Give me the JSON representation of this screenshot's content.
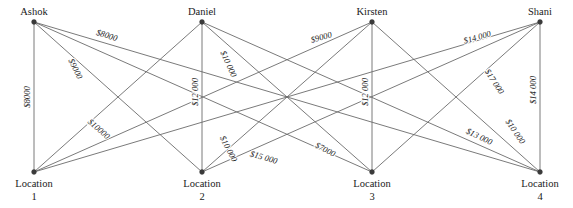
{
  "diagram": {
    "type": "bipartite-assignment-graph",
    "title": "",
    "people": [
      {
        "id": "ashok",
        "label": "Ashok",
        "x": 34,
        "y": 22
      },
      {
        "id": "daniel",
        "label": "Daniel",
        "x": 202,
        "y": 22
      },
      {
        "id": "kirsten",
        "label": "Kirsten",
        "x": 372,
        "y": 22
      },
      {
        "id": "shani",
        "label": "Shani",
        "x": 540,
        "y": 22
      }
    ],
    "locations": [
      {
        "id": "loc1",
        "label": "Location",
        "sub": "1",
        "x": 34,
        "y": 172
      },
      {
        "id": "loc2",
        "label": "Location",
        "sub": "2",
        "x": 202,
        "y": 172
      },
      {
        "id": "loc3",
        "label": "Location",
        "sub": "3",
        "x": 372,
        "y": 172
      },
      {
        "id": "loc4",
        "label": "Location",
        "sub": "4",
        "x": 540,
        "y": 172
      }
    ],
    "edges": [
      {
        "from": "ashok",
        "to": "loc1",
        "cost": "$8000",
        "value": 8000,
        "label_t": 0.52,
        "show": true,
        "lx": 30,
        "ly": 97,
        "rot": -90
      },
      {
        "from": "ashok",
        "to": "loc2",
        "cost": "$10000",
        "value": 10000,
        "label_t": 0.68,
        "show": true,
        "lx": 97,
        "ly": 131,
        "rot": 41
      },
      {
        "from": "ashok",
        "to": "loc3",
        "cost": "$9000",
        "value": 9000,
        "label_t": 0.3,
        "show": true,
        "lx": 73,
        "ly": 70,
        "rot": 64
      },
      {
        "from": "ashok",
        "to": "loc4",
        "cost": "$8000",
        "value": 8000,
        "label_t": 0.22,
        "show": true,
        "lx": 106,
        "ly": 38,
        "rot": 17
      },
      {
        "from": "daniel",
        "to": "loc1",
        "cost": "",
        "value": null,
        "label_t": 0,
        "show": false,
        "lx": 0,
        "ly": 0,
        "rot": 0
      },
      {
        "from": "daniel",
        "to": "loc2",
        "cost": "$12 000",
        "value": 12000,
        "label_t": 0.5,
        "show": true,
        "lx": 198,
        "ly": 92,
        "rot": -90
      },
      {
        "from": "daniel",
        "to": "loc3",
        "cost": "$10 000",
        "value": 10000,
        "label_t": 0.28,
        "show": true,
        "lx": 226,
        "ly": 65,
        "rot": 66
      },
      {
        "from": "daniel",
        "to": "loc4",
        "cost": "",
        "value": null,
        "label_t": 0,
        "show": false,
        "lx": 0,
        "ly": 0,
        "rot": 0
      },
      {
        "from": "kirsten",
        "to": "loc1",
        "cost": "$9000",
        "value": 9000,
        "label_t": 0.18,
        "show": true,
        "lx": 322,
        "ly": 40,
        "rot": -16
      },
      {
        "from": "kirsten",
        "to": "loc2",
        "cost": "$10 000",
        "value": 10000,
        "label_t": 0.8,
        "show": true,
        "lx": 226,
        "ly": 150,
        "rot": 63
      },
      {
        "from": "kirsten",
        "to": "loc3",
        "cost": "$12 000",
        "value": 12000,
        "label_t": 0.5,
        "show": true,
        "lx": 368,
        "ly": 92,
        "rot": -90
      },
      {
        "from": "kirsten",
        "to": "loc4",
        "cost": "",
        "value": null,
        "label_t": 0,
        "show": false,
        "lx": 0,
        "ly": 0,
        "rot": 0
      },
      {
        "from": "shani",
        "to": "loc1",
        "cost": "$15 000",
        "value": 15000,
        "label_t": 0.82,
        "show": true,
        "lx": 263,
        "ly": 160,
        "rot": 16
      },
      {
        "from": "shani",
        "to": "loc2",
        "cost": "$13 000",
        "value": 13000,
        "label_t": 0.68,
        "show": true,
        "lx": 478,
        "ly": 139,
        "rot": 26
      },
      {
        "from": "shani",
        "to": "loc3",
        "cost": "$17 000",
        "value": 17000,
        "label_t": 0.35,
        "show": true,
        "lx": 492,
        "ly": 83,
        "rot": 57
      },
      {
        "from": "shani",
        "to": "loc4",
        "cost": "$14 000",
        "value": 14000,
        "label_t": 0.5,
        "show": true,
        "lx": 536,
        "ly": 90,
        "rot": -90
      },
      {
        "from": "shani",
        "to": "loc1b",
        "cost": "$14 000",
        "value": 14000,
        "label_t": 0.22,
        "show": true,
        "lx": 478,
        "ly": 40,
        "rot": -16
      },
      {
        "from": "daniel",
        "to": "loc3b",
        "cost": "$7000",
        "value": 7000,
        "label_t": 0.78,
        "show": true,
        "lx": 324,
        "ly": 152,
        "rot": 27
      },
      {
        "from": "kirsten",
        "to": "loc4b",
        "cost": "$10 000",
        "value": 10000,
        "label_t": 0.72,
        "show": true,
        "lx": 513,
        "ly": 133,
        "rot": 56
      }
    ],
    "edge_pairs": [
      [
        "ashok",
        "loc1"
      ],
      [
        "ashok",
        "loc2"
      ],
      [
        "ashok",
        "loc3"
      ],
      [
        "ashok",
        "loc4"
      ],
      [
        "daniel",
        "loc1"
      ],
      [
        "daniel",
        "loc2"
      ],
      [
        "daniel",
        "loc3"
      ],
      [
        "daniel",
        "loc4"
      ],
      [
        "kirsten",
        "loc1"
      ],
      [
        "kirsten",
        "loc2"
      ],
      [
        "kirsten",
        "loc3"
      ],
      [
        "kirsten",
        "loc4"
      ],
      [
        "shani",
        "loc1"
      ],
      [
        "shani",
        "loc2"
      ],
      [
        "shani",
        "loc3"
      ],
      [
        "shani",
        "loc4"
      ]
    ],
    "costs": {
      "ashok": {
        "loc1": "$8000",
        "loc2": "$10000",
        "loc3": "$9000",
        "loc4": "$8000"
      },
      "daniel": {
        "loc1": "",
        "loc2": "$12 000",
        "loc3": "$10 000",
        "loc4": "$7000"
      },
      "kirsten": {
        "loc1": "$9000",
        "loc2": "$10 000",
        "loc3": "$12 000",
        "loc4": "$10 000"
      },
      "shani": {
        "loc1": "$14 000",
        "loc2": "$15 000",
        "loc3": "$17 000",
        "loc4": "$14 000"
      }
    },
    "visible_costs": [
      "$8000",
      "$9000",
      "$8000",
      "$10000",
      "$12 000",
      "$10 000",
      "$9000",
      "$12 000",
      "$14 000",
      "$14 000",
      "$17 000",
      "$10 000",
      "$15 000",
      "$7000",
      "$13 000",
      "$10 000"
    ],
    "colors": {
      "edge": "#6b6b6b",
      "node": "#3a3a3a",
      "text": "#1a1a1a",
      "background": "#ffffff"
    }
  }
}
